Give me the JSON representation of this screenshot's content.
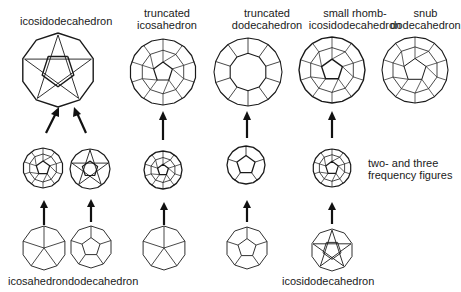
{
  "title_labels": {
    "icosidodecahedron": "icosidodecahedron",
    "truncated_icosahedron": [
      "truncated",
      "icosahedron"
    ],
    "truncated_dodecahedron": [
      "truncated",
      "dodecahedron"
    ],
    "small_rhombicosidodecahedron": [
      "small rhomb-",
      "icosidodecahedron"
    ],
    "snub_dodecahedron": [
      "snub",
      "dodecahedron"
    ]
  },
  "note": [
    "two- and three",
    "frequency figures"
  ],
  "bottom_labels": {
    "icosahedron": "icosahedron",
    "dodecahedron": "dodecahedron",
    "icosidodecahedron": "icosidodecahedron"
  },
  "figures": {
    "top": [
      "icosidodecahedron",
      "truncated icosahedron",
      "truncated dodecahedron",
      "small rhombicosidodecahedron",
      "snub dodecahedron"
    ],
    "middle": [
      "icosahedron frequency",
      "dodecahedron frequency",
      "truncated icosahedron frequency",
      "truncated dodecahedron frequency",
      "rhombicosidodecahedron frequency"
    ],
    "bottom": [
      "icosahedron",
      "dodecahedron",
      "icosahedron",
      "dodecahedron",
      "icosidodecahedron"
    ]
  },
  "line_color": "#1a1a1a"
}
